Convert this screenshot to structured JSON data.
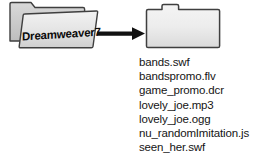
{
  "diagram": {
    "type": "folder-copy-flow",
    "background_color": "#ffffff",
    "source_folder": {
      "label": "Dreamweaver7",
      "style": "open-folder",
      "fill_color": "#e8e8e8",
      "outline_color": "#3a3a3a",
      "icon": "open-folder-icon"
    },
    "arrow": {
      "direction": "right",
      "color": "#111111",
      "icon": "right-arrow-icon"
    },
    "destination_folder": {
      "label": "Tutorial",
      "style": "closed-folder",
      "fill_color": "#eeeeee",
      "outline_color": "#3a3a3a",
      "icon": "closed-folder-icon"
    },
    "files": [
      {
        "name": "bands.swf"
      },
      {
        "name": "bandspromo.flv"
      },
      {
        "name": "game_promo.dcr"
      },
      {
        "name": "lovely_joe.mp3"
      },
      {
        "name": "lovely_joe.ogg"
      },
      {
        "name": "nu_randomImitation.js"
      },
      {
        "name": "seen_her.swf"
      }
    ]
  }
}
